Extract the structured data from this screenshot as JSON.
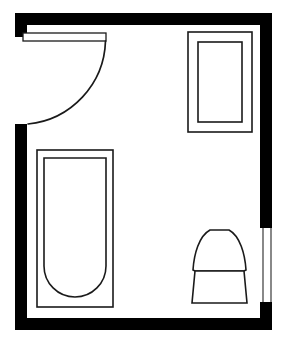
{
  "plan": {
    "title": "Bathroom Floor Plan",
    "canvas": {
      "width": 285,
      "height": 345,
      "background": "#ffffff"
    },
    "colors": {
      "wall": "#000000",
      "fixture_stroke": "#1a1a1a",
      "fixture_fill": "#ffffff",
      "window_stroke": "#3a3a3a"
    },
    "room": {
      "name": "bathroom",
      "outer_bounds": {
        "x": 15,
        "y": 13,
        "width": 257,
        "height": 317
      },
      "wall_thickness": 12
    },
    "walls": [
      {
        "name": "top-wall",
        "label": "Top Wall",
        "shape": "rect",
        "x": 15,
        "y": 13,
        "width": 257,
        "height": 12
      },
      {
        "name": "right-wall-upper",
        "label": "Right Wall Upper",
        "shape": "rect",
        "x": 260,
        "y": 13,
        "width": 12,
        "height": 215
      },
      {
        "name": "right-wall-lower",
        "label": "Right Wall Lower",
        "shape": "rect",
        "x": 260,
        "y": 302,
        "width": 12,
        "height": 28
      },
      {
        "name": "bottom-wall",
        "label": "Bottom Wall",
        "shape": "rect",
        "x": 15,
        "y": 318,
        "width": 257,
        "height": 12
      },
      {
        "name": "left-wall-upper",
        "label": "Left Wall Upper",
        "shape": "rect",
        "x": 15,
        "y": 13,
        "width": 12,
        "height": 24
      },
      {
        "name": "left-wall-lower",
        "label": "Left Wall Lower",
        "shape": "rect",
        "x": 15,
        "y": 124,
        "width": 12,
        "height": 206
      }
    ],
    "door": {
      "name": "entry-door",
      "label": "Entry Door",
      "type": "hinged-swing",
      "panel": {
        "x": 23,
        "y": 33,
        "width": 83,
        "height": 8
      },
      "hinge": {
        "x": 105,
        "y": 40
      },
      "arc_radius": 86,
      "arc_start": {
        "x": 105,
        "y": 40
      },
      "arc_end": {
        "x": 27,
        "y": 124
      },
      "opening_span": {
        "from_y": 37,
        "to_y": 124
      }
    },
    "window": {
      "name": "right-wall-window",
      "label": "Window",
      "x": 262,
      "y": 228,
      "width": 9,
      "height": 74
    },
    "fixtures": [
      {
        "name": "shower-stall",
        "label": "Shower Stall",
        "type": "nested-rectangle",
        "outer": {
          "x": 188,
          "y": 32,
          "width": 64,
          "height": 100
        },
        "inner": {
          "x": 198,
          "y": 42,
          "width": 44,
          "height": 80
        }
      },
      {
        "name": "bathtub",
        "label": "Bathtub",
        "type": "tub-rounded-end",
        "outer": {
          "x": 37,
          "y": 150,
          "width": 76,
          "height": 157
        },
        "inner": {
          "x": 44,
          "y": 158,
          "width": 62,
          "height": 139,
          "corner_radius": 31
        }
      },
      {
        "name": "toilet",
        "label": "Toilet",
        "type": "bowl-and-tank",
        "bounds": {
          "x": 192,
          "y": 230,
          "width": 55,
          "height": 73
        },
        "bowl_top_y": 230,
        "base_bottom_y": 303
      }
    ]
  }
}
